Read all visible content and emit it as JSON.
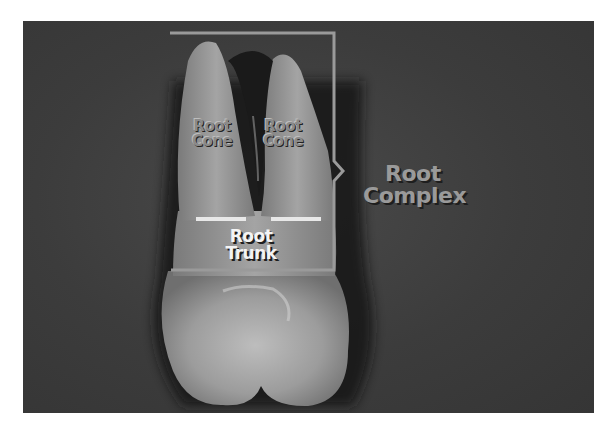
{
  "figure": {
    "labels": {
      "root_cone_left": [
        "Root",
        "Cone"
      ],
      "root_cone_right": [
        "Root",
        "Cone"
      ],
      "root_trunk": [
        "Root",
        "Trunk"
      ],
      "root_complex": [
        "Root",
        "Complex"
      ]
    },
    "colors": {
      "background": "#3c3c3c",
      "bracket": "#9a9a9a",
      "cej_lines": "#e8e8e8",
      "trunk_text": "#f4f4f4",
      "complex_text": "#9a9a9a"
    }
  }
}
